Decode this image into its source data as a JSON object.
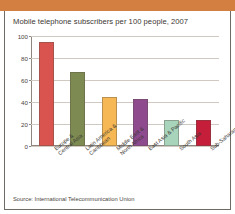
{
  "figure": {
    "title": "Mobile telephone subscribers per 100 people, 2007",
    "source": "Source: International Telecommunication Union",
    "band_color": "#d47f42",
    "border_color": "#6f6a63"
  },
  "chart_data": {
    "type": "bar",
    "title": "Mobile telephone subscribers per 100 people, 2007",
    "xlabel": "",
    "ylabel": "",
    "ylim": [
      0,
      100
    ],
    "yticks": [
      0,
      20,
      40,
      60,
      80,
      100
    ],
    "ytick_labels": [
      "0",
      "20",
      "40",
      "60",
      "80",
      "100"
    ],
    "grid": true,
    "legend": "none",
    "categories": [
      "Europe &\nCentral Asia",
      "Latin America &\nCaribbean",
      "Middle East &\nNorth Africa",
      "East Asia & Pacific",
      "South Asia",
      "Sub-Saharan Africa"
    ],
    "category_lines": [
      [
        "Europe &",
        "Central Asia"
      ],
      [
        "Latin America &",
        "Caribbean"
      ],
      [
        "Middle East &",
        "North Africa"
      ],
      [
        "East Asia & Pacific"
      ],
      [
        "South Asia"
      ],
      [
        "Sub-Saharan Africa"
      ]
    ],
    "values": [
      95,
      67,
      45,
      43,
      24,
      24
    ],
    "colors": [
      "#d9544f",
      "#7d8b52",
      "#f5b855",
      "#8e4b8e",
      "#a8d4bc",
      "#c41e3a"
    ],
    "bars": [
      {
        "label": "Europe & Central Asia",
        "value": 95,
        "color": "#d9544f"
      },
      {
        "label": "Latin America & Caribbean",
        "value": 67,
        "color": "#7d8b52"
      },
      {
        "label": "Middle East & North Africa",
        "value": 45,
        "color": "#f5b855"
      },
      {
        "label": "East Asia & Pacific",
        "value": 43,
        "color": "#8e4b8e"
      },
      {
        "label": "South Asia",
        "value": 24,
        "color": "#a8d4bc"
      },
      {
        "label": "Sub-Saharan Africa",
        "value": 24,
        "color": "#c41e3a"
      }
    ]
  }
}
